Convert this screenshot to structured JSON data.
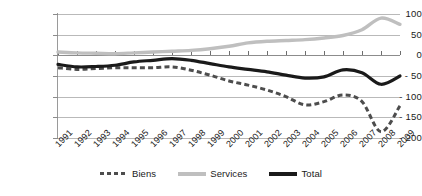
{
  "chart_data": {
    "type": "line",
    "title": "",
    "subtitle": "",
    "xlabel": "",
    "ylabel": "",
    "grid": true,
    "legend_position": "bottom",
    "ylim": [
      -200,
      100
    ],
    "ytick_labels": [
      "100",
      "50",
      "0",
      "- 50",
      "- 100",
      "- 150",
      "- 200"
    ],
    "ytick_values": [
      100,
      50,
      0,
      -50,
      -100,
      -150,
      -200
    ],
    "categories": [
      "1991",
      "1992",
      "1993",
      "1994",
      "1995",
      "1996",
      "1997",
      "1998",
      "1999",
      "2000",
      "2001",
      "2002",
      "2003",
      "2004",
      "2005",
      "2006",
      "2007",
      "2008",
      "2009"
    ],
    "series": [
      {
        "name": "Biens",
        "style": "dashed",
        "color": "#4d4d4d",
        "values": [
          -30,
          -34,
          -32,
          -30,
          -30,
          -30,
          -28,
          -36,
          -48,
          -62,
          -72,
          -84,
          -100,
          -120,
          -112,
          -96,
          -112,
          -185,
          -122
        ]
      },
      {
        "name": "Services",
        "style": "solid",
        "color": "#bfbfbf",
        "values": [
          8,
          6,
          5,
          4,
          6,
          8,
          10,
          12,
          16,
          22,
          30,
          34,
          36,
          38,
          42,
          48,
          62,
          90,
          75
        ]
      },
      {
        "name": "Total",
        "style": "solid",
        "color": "#1a1a1a",
        "values": [
          -22,
          -28,
          -27,
          -24,
          -16,
          -12,
          -8,
          -12,
          -20,
          -28,
          -34,
          -40,
          -48,
          -55,
          -52,
          -35,
          -42,
          -70,
          -50
        ]
      }
    ]
  },
  "legend": {
    "items": [
      {
        "label": "Biens"
      },
      {
        "label": "Services"
      },
      {
        "label": "Total"
      }
    ]
  },
  "colors": {
    "biens": "#4d4d4d",
    "services": "#bfbfbf",
    "total": "#1a1a1a",
    "grid": "#b9b9b9",
    "axis": "#8c8c8c",
    "text": "#1a1a1a"
  }
}
